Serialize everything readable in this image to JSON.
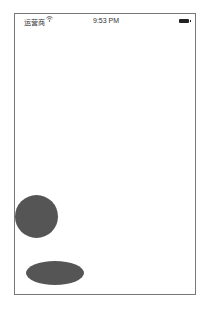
{
  "status_bar": {
    "carrier": "运营商",
    "wifi_icon": "wifi-icon",
    "time": "9:53 PM",
    "battery_icon": "battery-icon"
  },
  "canvas": {
    "shapes": [
      {
        "type": "circle",
        "color": "#555555"
      },
      {
        "type": "ellipse",
        "color": "#555555"
      }
    ]
  }
}
